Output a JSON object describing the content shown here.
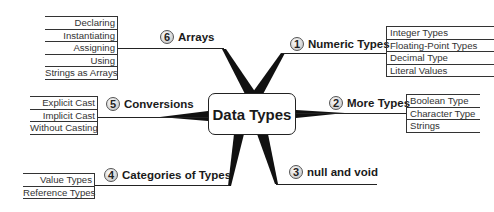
{
  "center": {
    "label": "Data Types"
  },
  "branches": [
    {
      "number": "1",
      "label": "Numeric Types",
      "items": [
        "Integer Types",
        "Floating-Point Types",
        "Decimal Type",
        "Literal Values"
      ]
    },
    {
      "number": "2",
      "label": "More Types",
      "items": [
        "Boolean Type",
        "Character Type",
        "Strings"
      ]
    },
    {
      "number": "3",
      "label": "null and void",
      "items": []
    },
    {
      "number": "4",
      "label": "Categories of Types",
      "items": [
        "Value Types",
        "Reference Types"
      ]
    },
    {
      "number": "5",
      "label": "Conversions",
      "items": [
        "Explicit Cast",
        "Implicit Cast",
        "Without Casting"
      ]
    },
    {
      "number": "6",
      "label": "Arrays",
      "items": [
        "Declaring",
        "Instantiating",
        "Assigning",
        "Using",
        "Strings as Arrays"
      ]
    }
  ],
  "colors": {
    "line": "#1a1a1a",
    "background": "#ffffff"
  }
}
